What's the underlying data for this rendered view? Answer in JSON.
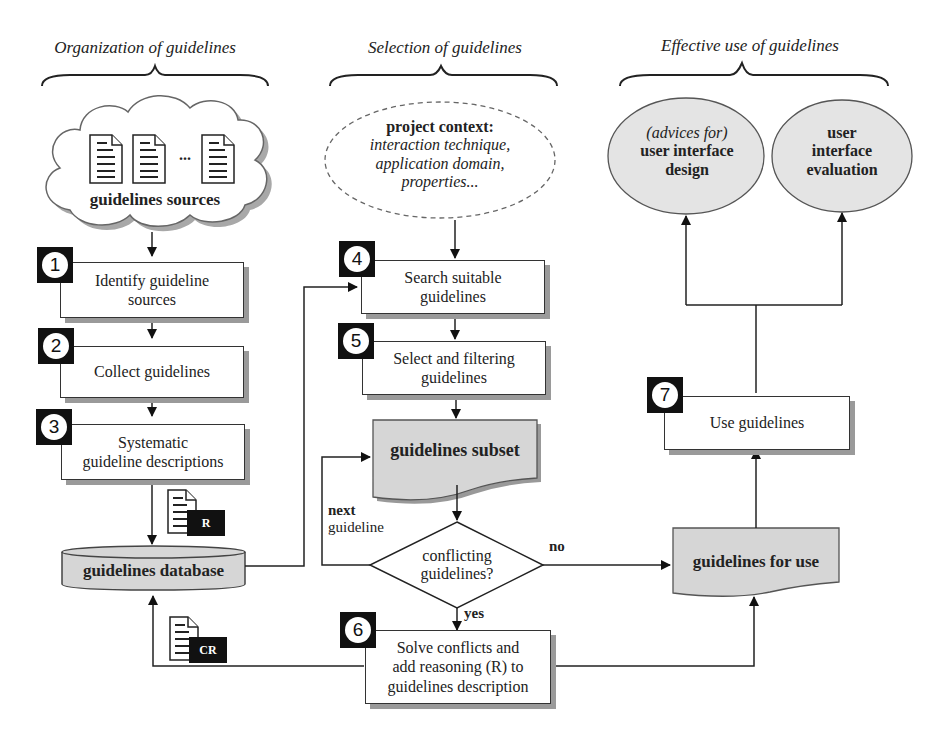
{
  "sections": {
    "organization": "Organization of guidelines",
    "selection": "Selection of guidelines",
    "effective_use": "Effective use of guidelines"
  },
  "cloud": {
    "label": "guidelines sources",
    "ellipsis": "..."
  },
  "project_context": {
    "title": "project context:",
    "line1": "interaction technique,",
    "line2": "application domain,",
    "line3": "properties..."
  },
  "outcomes": {
    "design_prefix": "(advices for)",
    "design_line1": "user interface",
    "design_line2": "design",
    "eval_line1": "user",
    "eval_line2": "interface",
    "eval_line3": "evaluation"
  },
  "steps": [
    {
      "num": "1",
      "line1": "Identify guideline",
      "line2": "sources"
    },
    {
      "num": "2",
      "line1": "Collect guidelines",
      "line2": ""
    },
    {
      "num": "3",
      "line1": "Systematic",
      "line2": "guideline descriptions"
    },
    {
      "num": "4",
      "line1": "Search suitable",
      "line2": "guidelines"
    },
    {
      "num": "5",
      "line1": "Select and filtering",
      "line2": "guidelines"
    },
    {
      "num": "6",
      "line1": "Solve conflicts and",
      "line2": "add reasoning (R) to",
      "line3": "guidelines description"
    },
    {
      "num": "7",
      "line1": "Use guidelines",
      "line2": ""
    }
  ],
  "database": {
    "label": "guidelines database"
  },
  "documents": {
    "subset": "guidelines subset",
    "for_use": "guidelines for use"
  },
  "decision": {
    "line1": "conflicting",
    "line2": "guidelines?",
    "yes": "yes",
    "no": "no",
    "loop_bold": "next",
    "loop_rest": "guideline"
  },
  "doc_tags": {
    "r": "R",
    "cr": "CR"
  },
  "colors": {
    "fill_gray": "#d6d6d6",
    "ellipse_fill": "#e4e4e4",
    "shadow": "#9a9a9a",
    "badge": "#111111"
  }
}
